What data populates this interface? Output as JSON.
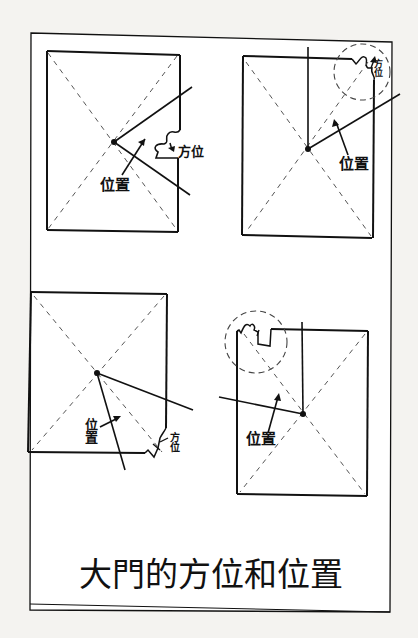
{
  "title": "大門的方位和位置",
  "panels": [
    {
      "id": "top-left",
      "direction_label": "方位",
      "position_label": "位置",
      "door_side": "right"
    },
    {
      "id": "top-right",
      "direction_label": "方位",
      "position_label": "位置",
      "door_side": "top-right corner (circled)"
    },
    {
      "id": "bottom-left",
      "direction_label": "方位",
      "position_label": "位置",
      "door_side": "bottom-right corner"
    },
    {
      "id": "bottom-right",
      "direction_label": "方位",
      "position_label": "位置",
      "door_side": "top-left corner (circled)"
    }
  ],
  "colors": {
    "ink": "#111111",
    "paper": "#ffffff",
    "background": "#f4f3f0",
    "dash": "#555555"
  }
}
